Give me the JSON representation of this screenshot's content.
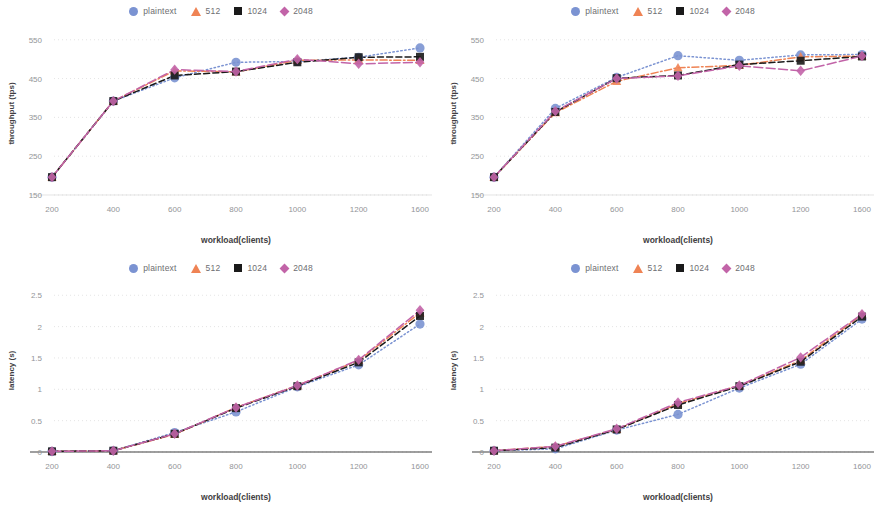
{
  "figure": {
    "panel_count": 4,
    "legend_entries": [
      {
        "label": "plaintext",
        "marker": "circle-marker",
        "color": "#7b93d2",
        "dash": "dotted"
      },
      {
        "label": "512",
        "marker": "triangle-marker",
        "color": "#ef8354",
        "dash": "dash-dot"
      },
      {
        "label": "1024",
        "marker": "square-marker",
        "color": "#1a1a1a",
        "dash": "dashed"
      },
      {
        "label": "2048",
        "marker": "diamond-marker",
        "color": "#c264a8",
        "dash": "long-dash"
      }
    ]
  },
  "chart_data": [
    {
      "id": "top-left",
      "type": "line",
      "title": "",
      "xlabel": "workload(clients)",
      "ylabel": "throughput (tps)",
      "categories": [
        "200",
        "400",
        "600",
        "800",
        "1000",
        "1200",
        "1600"
      ],
      "xticks": [
        "200",
        "400",
        "600",
        "800",
        "1000",
        "1200",
        "1600"
      ],
      "yticks": [
        "150",
        "250",
        "350",
        "450",
        "550"
      ],
      "ylim": [
        150,
        570
      ],
      "grid": true,
      "legend_position": "top-center",
      "series": [
        {
          "name": "plaintext",
          "color": "#7b93d2",
          "marker": "circle",
          "dash": "dotted",
          "values": [
            196,
            392,
            452,
            492,
            494,
            505,
            529
          ]
        },
        {
          "name": "512",
          "color": "#ef8354",
          "marker": "triangle",
          "dash": "dash-dot",
          "values": [
            196,
            392,
            470,
            467,
            497,
            498,
            497
          ]
        },
        {
          "name": "1024",
          "color": "#1a1a1a",
          "marker": "square",
          "dash": "dashed",
          "values": [
            196,
            392,
            458,
            468,
            492,
            505,
            506
          ]
        },
        {
          "name": "2048",
          "color": "#c264a8",
          "marker": "diamond",
          "dash": "long-dash",
          "values": [
            196,
            392,
            473,
            468,
            500,
            488,
            492
          ]
        }
      ]
    },
    {
      "id": "top-right",
      "type": "line",
      "title": "",
      "xlabel": "workload(clients)",
      "ylabel": "throughput (tps)",
      "categories": [
        "200",
        "400",
        "600",
        "800",
        "1000",
        "1200",
        "1600"
      ],
      "xticks": [
        "200",
        "400",
        "600",
        "800",
        "1000",
        "1200",
        "1600"
      ],
      "yticks": [
        "150",
        "250",
        "350",
        "450",
        "550"
      ],
      "ylim": [
        150,
        570
      ],
      "grid": true,
      "legend_position": "top-center",
      "series": [
        {
          "name": "plaintext",
          "color": "#7b93d2",
          "marker": "circle",
          "dash": "dotted",
          "values": [
            196,
            373,
            453,
            509,
            497,
            511,
            512
          ]
        },
        {
          "name": "512",
          "color": "#ef8354",
          "marker": "triangle",
          "dash": "dash-dot",
          "values": [
            196,
            362,
            443,
            478,
            484,
            506,
            508
          ]
        },
        {
          "name": "1024",
          "color": "#1a1a1a",
          "marker": "square",
          "dash": "dashed",
          "values": [
            196,
            364,
            451,
            458,
            486,
            496,
            507
          ]
        },
        {
          "name": "2048",
          "color": "#c264a8",
          "marker": "diamond",
          "dash": "long-dash",
          "values": [
            196,
            366,
            450,
            457,
            483,
            470,
            508
          ]
        }
      ]
    },
    {
      "id": "bottom-left",
      "type": "line",
      "title": "",
      "xlabel": "workload(clients)",
      "ylabel": "latency (s)",
      "categories": [
        "200",
        "400",
        "600",
        "800",
        "1000",
        "1200",
        "1600"
      ],
      "xticks": [
        "200",
        "400",
        "600",
        "800",
        "1000",
        "1200",
        "1600"
      ],
      "yticks": [
        "0",
        "0.5",
        "1",
        "1.5",
        "2",
        "2.5"
      ],
      "ylim": [
        0,
        2.6
      ],
      "grid": true,
      "legend_position": "top-center",
      "series": [
        {
          "name": "plaintext",
          "color": "#7b93d2",
          "marker": "circle",
          "dash": "dotted",
          "values": [
            0.01,
            0.02,
            0.31,
            0.64,
            1.04,
            1.39,
            2.04
          ]
        },
        {
          "name": "512",
          "color": "#ef8354",
          "marker": "triangle",
          "dash": "dash-dot",
          "values": [
            0.01,
            0.02,
            0.28,
            0.71,
            1.06,
            1.46,
            2.22
          ]
        },
        {
          "name": "1024",
          "color": "#1a1a1a",
          "marker": "square",
          "dash": "dashed",
          "values": [
            0.01,
            0.02,
            0.29,
            0.7,
            1.05,
            1.43,
            2.17
          ]
        },
        {
          "name": "2048",
          "color": "#c264a8",
          "marker": "diamond",
          "dash": "long-dash",
          "values": [
            0.01,
            0.02,
            0.29,
            0.71,
            1.06,
            1.47,
            2.26
          ]
        }
      ]
    },
    {
      "id": "bottom-right",
      "type": "line",
      "title": "",
      "xlabel": "workload(clients)",
      "ylabel": "latency (s)",
      "categories": [
        "200",
        "400",
        "600",
        "800",
        "1000",
        "1200",
        "1600"
      ],
      "xticks": [
        "200",
        "400",
        "600",
        "800",
        "1000",
        "1200",
        "1600"
      ],
      "yticks": [
        "0",
        "0.5",
        "1",
        "1.5",
        "2",
        "2.5"
      ],
      "ylim": [
        0,
        2.6
      ],
      "grid": true,
      "legend_position": "top-center",
      "series": [
        {
          "name": "plaintext",
          "color": "#7b93d2",
          "marker": "circle",
          "dash": "dotted",
          "values": [
            0.02,
            0.05,
            0.35,
            0.6,
            1.02,
            1.4,
            2.12
          ]
        },
        {
          "name": "512",
          "color": "#ef8354",
          "marker": "triangle",
          "dash": "dash-dot",
          "values": [
            0.02,
            0.09,
            0.36,
            0.77,
            1.06,
            1.46,
            2.19
          ]
        },
        {
          "name": "1024",
          "color": "#1a1a1a",
          "marker": "square",
          "dash": "dashed",
          "values": [
            0.02,
            0.07,
            0.36,
            0.75,
            1.05,
            1.44,
            2.16
          ]
        },
        {
          "name": "2048",
          "color": "#c264a8",
          "marker": "diamond",
          "dash": "long-dash",
          "values": [
            0.02,
            0.09,
            0.37,
            0.79,
            1.06,
            1.51,
            2.2
          ]
        }
      ]
    }
  ]
}
